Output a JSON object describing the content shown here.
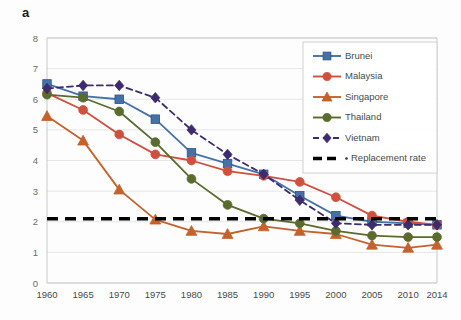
{
  "panel": {
    "label": "a"
  },
  "chart_data": {
    "type": "line",
    "title": "",
    "subtitle": "",
    "xlabel": "",
    "ylabel": "",
    "grid": true,
    "legend_position": "top-right",
    "categories": [
      "1960",
      "1965",
      "1970",
      "1975",
      "1980",
      "1985",
      "1990",
      "1995",
      "2000",
      "2005",
      "2010",
      "2014"
    ],
    "x": [
      1960,
      1965,
      1970,
      1975,
      1980,
      1985,
      1990,
      1995,
      2000,
      2005,
      2010,
      2014
    ],
    "xlim": [
      1960,
      2014
    ],
    "ylim": [
      0,
      8
    ],
    "yticks": [
      0,
      1,
      2,
      3,
      4,
      5,
      6,
      7,
      8
    ],
    "xticks": [
      1960,
      1965,
      1970,
      1975,
      1980,
      1985,
      1990,
      1995,
      2000,
      2005,
      2010,
      2014
    ],
    "series": [
      {
        "name": "Brunei",
        "color": "#4472A8",
        "marker": "square",
        "dashed": false,
        "values": [
          6.5,
          6.1,
          6.0,
          5.35,
          4.25,
          3.9,
          3.55,
          2.85,
          2.2,
          2.0,
          1.95,
          1.9
        ]
      },
      {
        "name": "Malaysia",
        "color": "#D0503E",
        "marker": "circle",
        "dashed": false,
        "values": [
          6.2,
          5.65,
          4.85,
          4.2,
          4.0,
          3.65,
          3.5,
          3.3,
          2.8,
          2.2,
          2.0,
          1.9
        ]
      },
      {
        "name": "Singapore",
        "color": "#C5622B",
        "marker": "triangle",
        "dashed": false,
        "values": [
          5.45,
          4.65,
          3.05,
          2.07,
          1.7,
          1.6,
          1.85,
          1.7,
          1.6,
          1.25,
          1.15,
          1.25
        ]
      },
      {
        "name": "Thailand",
        "color": "#5B6B2D",
        "marker": "circle",
        "dashed": false,
        "values": [
          6.15,
          6.05,
          5.6,
          4.6,
          3.4,
          2.55,
          2.1,
          1.95,
          1.7,
          1.55,
          1.5,
          1.5
        ]
      },
      {
        "name": "Vietnam",
        "color": "#3E2B6E",
        "marker": "diamond",
        "dashed": true,
        "values": [
          6.35,
          6.45,
          6.45,
          6.05,
          5.0,
          4.2,
          3.55,
          2.7,
          1.95,
          1.9,
          1.9,
          1.9
        ]
      }
    ],
    "reference_line": {
      "name": "Replacement rate",
      "value": 2.1,
      "color": "#000000",
      "style": "dashed"
    },
    "legend": [
      {
        "label": "Brunei",
        "color": "#4472A8",
        "marker": "square",
        "dashed": false
      },
      {
        "label": "Malaysia",
        "color": "#D0503E",
        "marker": "circle",
        "dashed": false
      },
      {
        "label": "Singapore",
        "color": "#C5622B",
        "marker": "triangle",
        "dashed": false
      },
      {
        "label": "Thailand",
        "color": "#5B6B2D",
        "marker": "circle",
        "dashed": false
      },
      {
        "label": "Vietnam",
        "color": "#3E2B6E",
        "marker": "diamond",
        "dashed": true
      },
      {
        "label": "Replacement rate",
        "color": "#000000",
        "marker": "none",
        "dashed": true,
        "thick": true
      }
    ]
  }
}
